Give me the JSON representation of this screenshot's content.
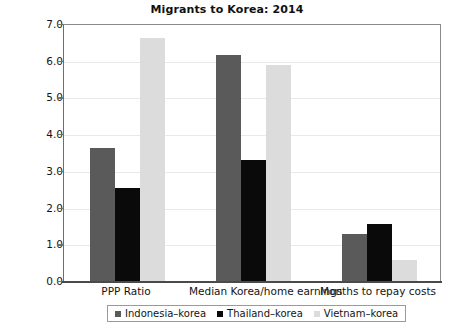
{
  "chart_data": {
    "type": "bar",
    "title": "Migrants to Korea: 2014",
    "xlabel": "",
    "ylabel": "",
    "ylim": [
      0.0,
      7.0
    ],
    "ytick_labels": [
      "0.0",
      "1.0",
      "2.0",
      "3.0",
      "4.0",
      "5.0",
      "6.0",
      "7.0"
    ],
    "ytick_values": [
      0.0,
      1.0,
      2.0,
      3.0,
      4.0,
      5.0,
      6.0,
      7.0
    ],
    "grid": true,
    "legend_position": "bottom",
    "categories": [
      "PPP Ratio",
      "Median Korea/home earnings",
      "Months to repay costs"
    ],
    "series": [
      {
        "name": "Indonesia–korea",
        "color": "#5a5a5a",
        "values": [
          3.62,
          6.16,
          1.27
        ]
      },
      {
        "name": "Thailand–korea",
        "color": "#0a0a0a",
        "values": [
          2.52,
          3.3,
          1.54
        ]
      },
      {
        "name": "Vietnam–korea",
        "color": "#dcdcdc",
        "values": [
          6.62,
          5.88,
          0.58
        ]
      }
    ]
  }
}
